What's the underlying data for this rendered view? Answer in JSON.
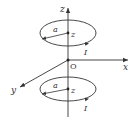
{
  "diagram": {
    "colors": {
      "stroke": "#333333",
      "background": "#ffffff"
    },
    "axes": {
      "z_label": "z",
      "x_label": "x",
      "y_label": "y",
      "origin_label": "O"
    },
    "upper_loop": {
      "radius_label": "a",
      "center_label": "z",
      "current_label": "I"
    },
    "lower_loop": {
      "radius_label": "a",
      "center_label": "z",
      "current_label": "I"
    }
  }
}
